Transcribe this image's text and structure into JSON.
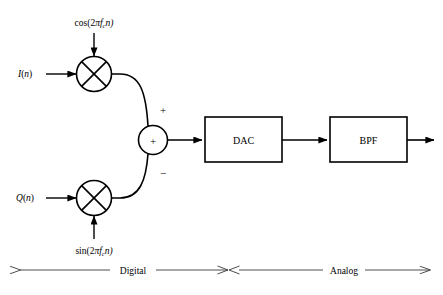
{
  "diagram": {
    "stroke_color": "#000000",
    "background_color": "#ffffff",
    "annotation_color": "#3a3a3a",
    "inputs": [
      {
        "id": "i-branch",
        "label": "I(n)",
        "base": "I",
        "arg": "n"
      },
      {
        "id": "q-branch",
        "label": "Q(n)",
        "base": "Q",
        "arg": "n"
      }
    ],
    "carriers": [
      {
        "id": "cos-carrier",
        "label": "cos(2πfₑn)",
        "func": "cos(2",
        "pi": "π",
        "f": "f",
        "subscript": "c",
        "tail": "n)"
      },
      {
        "id": "sin-carrier",
        "label": "sin(2πfₑn)",
        "func": "sin(2",
        "pi": "π",
        "f": "f",
        "subscript": "c",
        "tail": "n)"
      }
    ],
    "mixers": [
      {
        "id": "mixer-top",
        "symbol": "⊗",
        "name": "multiplier"
      },
      {
        "id": "mixer-bottom",
        "symbol": "⊗",
        "name": "multiplier"
      }
    ],
    "summer": {
      "id": "summing-junction",
      "center_symbol": "+",
      "top_port_sign": "+",
      "bottom_port_sign": "−"
    },
    "blocks": [
      {
        "id": "dac-block",
        "label": "DAC"
      },
      {
        "id": "bpf-block",
        "label": "BPF"
      }
    ],
    "domain_bar": {
      "digital_label": "Digital",
      "analog_label": "Analog"
    }
  }
}
